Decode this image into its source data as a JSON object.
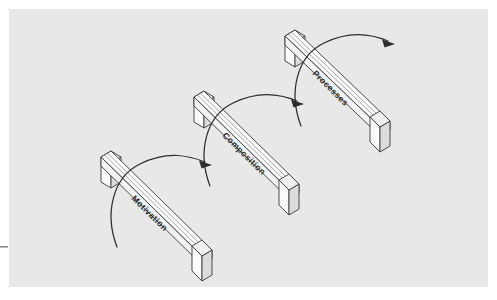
{
  "figure": {
    "title": "",
    "background_color": "#e8e8e8",
    "page_color": "#ffffff",
    "line_color": "#2d2d2d",
    "bar_top_color": "#fbfbfb",
    "bar_side_color": "#e2e2e2",
    "canvas": {
      "x": 9,
      "y": 9,
      "width": 479,
      "height": 278
    }
  },
  "diagram": {
    "type": "isometric-staircase-flow",
    "steps": [
      {
        "id": "step-motivation",
        "label": "Motivation",
        "order": 1,
        "position": "bottom-left"
      },
      {
        "id": "step-composition",
        "label": "Composition",
        "order": 2,
        "position": "middle-center"
      },
      {
        "id": "step-processes",
        "label": "Processes",
        "order": 3,
        "position": "top-right"
      }
    ],
    "connectors": [
      {
        "id": "arrow-motivation-to-composition",
        "from": "step-motivation",
        "to": "step-composition",
        "style": "curved-arrow"
      },
      {
        "id": "arrow-composition-to-processes",
        "from": "step-composition",
        "to": "step-processes",
        "style": "curved-arrow"
      },
      {
        "id": "arrow-processes-onward",
        "from": "step-processes",
        "to": "",
        "style": "curved-arrow"
      }
    ]
  }
}
